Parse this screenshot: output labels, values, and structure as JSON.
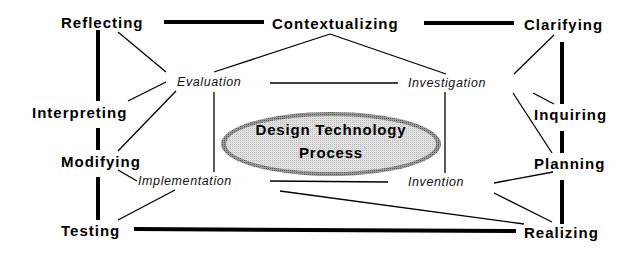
{
  "diagram": {
    "center": {
      "line1": "Design  Technology",
      "line2": "Process"
    },
    "outer_nodes": {
      "reflecting": "Reflecting",
      "contextualizing": "Contextualizing",
      "clarifying": "Clarifying",
      "interpreting": "Interpreting",
      "inquiring": "Inquiring",
      "modifying": "Modifying",
      "planning": "Planning",
      "testing": "Testing",
      "realizing": "Realizing"
    },
    "inner_nodes": {
      "evaluation": "Evaluation",
      "investigation": "Investigation",
      "implementation": "Implementation",
      "invention": "Invention"
    },
    "colors": {
      "ellipse_fill": "#d9d9d9",
      "ellipse_border": "#7a7a7a",
      "line": "#000000"
    }
  }
}
